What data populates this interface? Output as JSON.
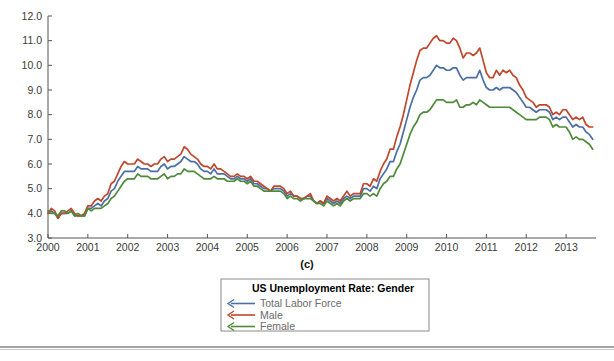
{
  "figure": {
    "panel_caption": "(c)"
  },
  "legend": {
    "title": "US Unemployment Rate: Gender",
    "entries": [
      {
        "label": "Total Labor Force",
        "color": "#4a6fa5",
        "marker": "left-arrow"
      },
      {
        "label": "Male",
        "color": "#c0472b",
        "marker": "left-arrow"
      },
      {
        "label": "Female",
        "color": "#4f8a3a",
        "marker": "left-arrow"
      }
    ]
  },
  "chart_data": {
    "type": "line",
    "title": "US Unemployment Rate: Gender",
    "xlabel": "",
    "ylabel": "",
    "xlim": [
      2000.0,
      2013.75
    ],
    "ylim": [
      3.0,
      12.0
    ],
    "ytick_labels": [
      "3.0",
      "4.0",
      "5.0",
      "6.0",
      "7.0",
      "8.0",
      "9.0",
      "10.0",
      "11.0",
      "12.0"
    ],
    "yticks": [
      3.0,
      4.0,
      5.0,
      6.0,
      7.0,
      8.0,
      9.0,
      10.0,
      11.0,
      12.0
    ],
    "xtick_labels": [
      "2000",
      "2001",
      "2002",
      "2003",
      "2004",
      "2005",
      "2006",
      "2007",
      "2008",
      "2009",
      "2010",
      "2011",
      "2012",
      "2013"
    ],
    "xticks": [
      2000,
      2001,
      2002,
      2003,
      2004,
      2005,
      2006,
      2007,
      2008,
      2009,
      2010,
      2011,
      2012,
      2013
    ],
    "grid": false,
    "legend_position": "below-center",
    "x": [
      2000.0,
      2000.083,
      2000.167,
      2000.25,
      2000.333,
      2000.417,
      2000.5,
      2000.583,
      2000.667,
      2000.75,
      2000.833,
      2000.917,
      2001.0,
      2001.083,
      2001.167,
      2001.25,
      2001.333,
      2001.417,
      2001.5,
      2001.583,
      2001.667,
      2001.75,
      2001.833,
      2001.917,
      2002.0,
      2002.083,
      2002.167,
      2002.25,
      2002.333,
      2002.417,
      2002.5,
      2002.583,
      2002.667,
      2002.75,
      2002.833,
      2002.917,
      2003.0,
      2003.083,
      2003.167,
      2003.25,
      2003.333,
      2003.417,
      2003.5,
      2003.583,
      2003.667,
      2003.75,
      2003.833,
      2003.917,
      2004.0,
      2004.083,
      2004.167,
      2004.25,
      2004.333,
      2004.417,
      2004.5,
      2004.583,
      2004.667,
      2004.75,
      2004.833,
      2004.917,
      2005.0,
      2005.083,
      2005.167,
      2005.25,
      2005.333,
      2005.417,
      2005.5,
      2005.583,
      2005.667,
      2005.75,
      2005.833,
      2005.917,
      2006.0,
      2006.083,
      2006.167,
      2006.25,
      2006.333,
      2006.417,
      2006.5,
      2006.583,
      2006.667,
      2006.75,
      2006.833,
      2006.917,
      2007.0,
      2007.083,
      2007.167,
      2007.25,
      2007.333,
      2007.417,
      2007.5,
      2007.583,
      2007.667,
      2007.75,
      2007.833,
      2007.917,
      2008.0,
      2008.083,
      2008.167,
      2008.25,
      2008.333,
      2008.417,
      2008.5,
      2008.583,
      2008.667,
      2008.75,
      2008.833,
      2008.917,
      2009.0,
      2009.083,
      2009.167,
      2009.25,
      2009.333,
      2009.417,
      2009.5,
      2009.583,
      2009.667,
      2009.75,
      2009.833,
      2009.917,
      2010.0,
      2010.083,
      2010.167,
      2010.25,
      2010.333,
      2010.417,
      2010.5,
      2010.583,
      2010.667,
      2010.75,
      2010.833,
      2010.917,
      2011.0,
      2011.083,
      2011.167,
      2011.25,
      2011.333,
      2011.417,
      2011.5,
      2011.583,
      2011.667,
      2011.75,
      2011.833,
      2011.917,
      2012.0,
      2012.083,
      2012.167,
      2012.25,
      2012.333,
      2012.417,
      2012.5,
      2012.583,
      2012.667,
      2012.75,
      2012.833,
      2012.917,
      2013.0,
      2013.083,
      2013.167,
      2013.25,
      2013.333,
      2013.417,
      2013.5,
      2013.583,
      2013.667
    ],
    "series": [
      {
        "name": "Total Labor Force",
        "color": "#4a6fa5",
        "values": [
          4.0,
          4.1,
          4.0,
          3.8,
          4.0,
          4.0,
          4.0,
          4.1,
          3.9,
          3.9,
          3.9,
          3.9,
          4.2,
          4.2,
          4.3,
          4.4,
          4.3,
          4.5,
          4.6,
          4.9,
          5.0,
          5.3,
          5.5,
          5.7,
          5.7,
          5.7,
          5.7,
          5.9,
          5.8,
          5.8,
          5.8,
          5.7,
          5.7,
          5.7,
          5.9,
          6.0,
          5.8,
          5.9,
          5.9,
          6.0,
          6.1,
          6.3,
          6.2,
          6.1,
          6.1,
          6.0,
          5.8,
          5.7,
          5.7,
          5.6,
          5.8,
          5.6,
          5.6,
          5.6,
          5.5,
          5.4,
          5.4,
          5.5,
          5.4,
          5.4,
          5.3,
          5.4,
          5.2,
          5.2,
          5.1,
          5.0,
          5.0,
          4.9,
          5.0,
          5.0,
          5.0,
          4.9,
          4.7,
          4.8,
          4.7,
          4.7,
          4.6,
          4.6,
          4.7,
          4.7,
          4.5,
          4.4,
          4.5,
          4.4,
          4.6,
          4.5,
          4.4,
          4.5,
          4.4,
          4.6,
          4.7,
          4.6,
          4.7,
          4.7,
          4.7,
          5.0,
          5.0,
          4.9,
          5.1,
          5.0,
          5.4,
          5.6,
          5.8,
          6.1,
          6.1,
          6.5,
          6.8,
          7.3,
          7.8,
          8.3,
          8.7,
          9.0,
          9.4,
          9.5,
          9.5,
          9.6,
          9.8,
          10.0,
          9.9,
          9.9,
          9.8,
          9.8,
          9.9,
          9.9,
          9.6,
          9.4,
          9.5,
          9.5,
          9.5,
          9.5,
          9.8,
          9.4,
          9.1,
          9.0,
          9.0,
          9.1,
          9.0,
          9.1,
          9.1,
          9.1,
          9.0,
          8.9,
          8.7,
          8.5,
          8.3,
          8.3,
          8.2,
          8.1,
          8.2,
          8.2,
          8.2,
          8.1,
          7.8,
          7.9,
          7.8,
          7.9,
          7.9,
          7.7,
          7.5,
          7.6,
          7.5,
          7.5,
          7.3,
          7.2,
          7.0
        ]
      },
      {
        "name": "Male",
        "color": "#c0472b",
        "values": [
          4.0,
          4.2,
          4.1,
          3.8,
          4.0,
          4.0,
          4.1,
          4.2,
          4.0,
          3.9,
          3.9,
          4.0,
          4.3,
          4.3,
          4.5,
          4.6,
          4.5,
          4.7,
          4.8,
          5.2,
          5.3,
          5.6,
          5.9,
          6.1,
          6.0,
          6.0,
          6.0,
          6.2,
          6.1,
          6.0,
          6.0,
          5.9,
          6.0,
          6.0,
          6.2,
          6.3,
          6.1,
          6.2,
          6.2,
          6.3,
          6.4,
          6.7,
          6.6,
          6.4,
          6.3,
          6.2,
          6.0,
          5.9,
          5.9,
          5.8,
          6.0,
          5.8,
          5.8,
          5.7,
          5.6,
          5.5,
          5.5,
          5.6,
          5.5,
          5.5,
          5.4,
          5.5,
          5.3,
          5.3,
          5.2,
          5.1,
          5.0,
          4.9,
          5.1,
          5.1,
          5.1,
          5.0,
          4.8,
          4.9,
          4.7,
          4.7,
          4.6,
          4.6,
          4.7,
          4.8,
          4.5,
          4.4,
          4.5,
          4.4,
          4.7,
          4.6,
          4.5,
          4.6,
          4.5,
          4.7,
          4.9,
          4.7,
          4.8,
          4.8,
          4.8,
          5.2,
          5.2,
          5.1,
          5.4,
          5.3,
          5.7,
          6.0,
          6.2,
          6.6,
          6.6,
          7.1,
          7.5,
          8.0,
          8.6,
          9.2,
          9.7,
          10.2,
          10.6,
          10.7,
          10.7,
          10.9,
          11.1,
          11.2,
          11.0,
          11.0,
          10.9,
          10.9,
          11.1,
          11.0,
          10.7,
          10.3,
          10.5,
          10.5,
          10.4,
          10.5,
          10.7,
          10.2,
          9.7,
          9.5,
          9.5,
          9.8,
          9.6,
          9.8,
          9.7,
          9.8,
          9.6,
          9.5,
          9.2,
          9.0,
          8.7,
          8.6,
          8.5,
          8.3,
          8.4,
          8.4,
          8.4,
          8.3,
          8.0,
          8.1,
          8.0,
          8.2,
          8.2,
          8.0,
          7.8,
          7.9,
          7.8,
          7.9,
          7.6,
          7.5,
          7.5
        ]
      },
      {
        "name": "Female",
        "color": "#4f8a3a",
        "values": [
          4.1,
          4.0,
          4.0,
          3.9,
          4.1,
          4.1,
          4.0,
          4.1,
          3.9,
          4.0,
          3.9,
          3.9,
          4.2,
          4.1,
          4.2,
          4.2,
          4.2,
          4.3,
          4.4,
          4.6,
          4.7,
          4.9,
          5.1,
          5.3,
          5.4,
          5.4,
          5.4,
          5.6,
          5.5,
          5.5,
          5.5,
          5.4,
          5.4,
          5.4,
          5.5,
          5.6,
          5.4,
          5.5,
          5.5,
          5.6,
          5.6,
          5.8,
          5.7,
          5.7,
          5.7,
          5.6,
          5.5,
          5.4,
          5.4,
          5.4,
          5.5,
          5.4,
          5.4,
          5.4,
          5.3,
          5.3,
          5.3,
          5.4,
          5.3,
          5.3,
          5.2,
          5.3,
          5.1,
          5.1,
          5.0,
          4.9,
          4.9,
          4.9,
          4.9,
          4.9,
          4.9,
          4.8,
          4.6,
          4.7,
          4.6,
          4.6,
          4.5,
          4.6,
          4.6,
          4.6,
          4.5,
          4.4,
          4.4,
          4.3,
          4.5,
          4.4,
          4.3,
          4.4,
          4.3,
          4.5,
          4.6,
          4.5,
          4.6,
          4.6,
          4.6,
          4.8,
          4.8,
          4.7,
          4.8,
          4.7,
          5.0,
          5.2,
          5.3,
          5.5,
          5.5,
          5.8,
          6.0,
          6.4,
          6.8,
          7.2,
          7.5,
          7.7,
          8.0,
          8.1,
          8.1,
          8.2,
          8.4,
          8.6,
          8.6,
          8.6,
          8.5,
          8.5,
          8.5,
          8.6,
          8.3,
          8.3,
          8.4,
          8.4,
          8.5,
          8.4,
          8.6,
          8.5,
          8.4,
          8.3,
          8.3,
          8.3,
          8.3,
          8.3,
          8.3,
          8.3,
          8.2,
          8.1,
          8.0,
          7.9,
          7.8,
          7.8,
          7.8,
          7.8,
          7.9,
          7.9,
          7.9,
          7.8,
          7.5,
          7.6,
          7.5,
          7.5,
          7.5,
          7.3,
          7.0,
          7.1,
          7.0,
          7.0,
          6.9,
          6.8,
          6.6
        ]
      }
    ]
  }
}
